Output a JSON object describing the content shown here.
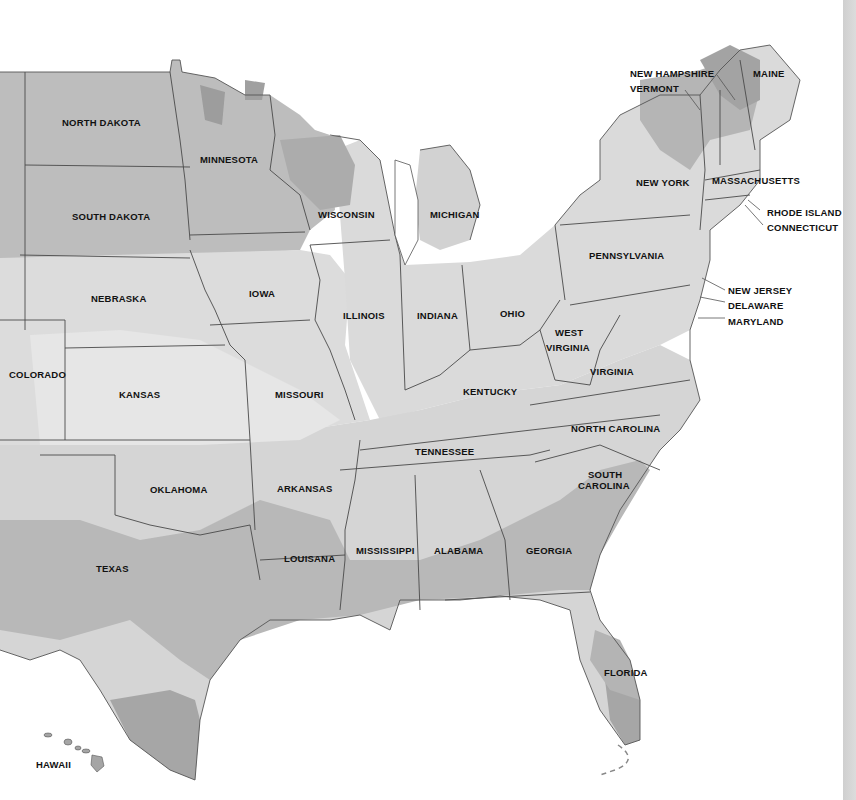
{
  "map": {
    "title": "United States regional shading map",
    "colors": {
      "background": "#ffffff",
      "lightest": "#ececec",
      "light": "#dedede",
      "medium": "#c6c6c6",
      "dark": "#a9a9a9",
      "darkest": "#8e8e8e",
      "border": "#4a4a4a",
      "label": "#111111"
    },
    "states": [
      {
        "name": "NORTH DAKOTA",
        "x": 62,
        "y": 117
      },
      {
        "name": "MINNESOTA",
        "x": 200,
        "y": 154
      },
      {
        "name": "SOUTH DAKOTA",
        "x": 72,
        "y": 211
      },
      {
        "name": "WISCONSIN",
        "x": 318,
        "y": 209
      },
      {
        "name": "MICHIGAN",
        "x": 430,
        "y": 209
      },
      {
        "name": "NEBRASKA",
        "x": 91,
        "y": 293
      },
      {
        "name": "IOWA",
        "x": 249,
        "y": 288
      },
      {
        "name": "ILLINOIS",
        "x": 343,
        "y": 310
      },
      {
        "name": "INDIANA",
        "x": 417,
        "y": 310
      },
      {
        "name": "OHIO",
        "x": 500,
        "y": 308
      },
      {
        "name": "COLORADO",
        "x": 9,
        "y": 369
      },
      {
        "name": "KANSAS",
        "x": 119,
        "y": 389
      },
      {
        "name": "MISSOURI",
        "x": 275,
        "y": 389
      },
      {
        "name": "KENTUCKY",
        "x": 463,
        "y": 386
      },
      {
        "name": "WEST",
        "x": 555,
        "y": 327
      },
      {
        "name": "VIRGINIA",
        "x": 546,
        "y": 342
      },
      {
        "name": "VIRGINIA",
        "x": 590,
        "y": 366
      },
      {
        "name": "PENNSYLVANIA",
        "x": 589,
        "y": 250
      },
      {
        "name": "NEW YORK",
        "x": 636,
        "y": 177
      },
      {
        "name": "NORTH CAROLINA",
        "x": 571,
        "y": 423
      },
      {
        "name": "TENNESSEE",
        "x": 415,
        "y": 446
      },
      {
        "name": "OKLAHOMA",
        "x": 150,
        "y": 484
      },
      {
        "name": "ARKANSAS",
        "x": 277,
        "y": 483
      },
      {
        "name": "SOUTH",
        "x": 588,
        "y": 469
      },
      {
        "name": "CAROLINA",
        "x": 578,
        "y": 480
      },
      {
        "name": "MISSISSIPPI",
        "x": 356,
        "y": 545
      },
      {
        "name": "ALABAMA",
        "x": 434,
        "y": 545
      },
      {
        "name": "GEORGIA",
        "x": 526,
        "y": 545
      },
      {
        "name": "TEXAS",
        "x": 96,
        "y": 563
      },
      {
        "name": "LOUISANA",
        "x": 284,
        "y": 553
      },
      {
        "name": "FLORIDA",
        "x": 604,
        "y": 667
      },
      {
        "name": "HAWAII",
        "x": 36,
        "y": 759
      }
    ],
    "callouts": [
      {
        "name": "NEW HAMPSHIRE",
        "x": 630,
        "y": 68
      },
      {
        "name": "VERMONT",
        "x": 630,
        "y": 83
      },
      {
        "name": "MAINE",
        "x": 753,
        "y": 68
      },
      {
        "name": "MASSACHUSETTS",
        "x": 712,
        "y": 175
      },
      {
        "name": "RHODE ISLAND",
        "x": 767,
        "y": 207
      },
      {
        "name": "CONNECTICUT",
        "x": 767,
        "y": 222
      },
      {
        "name": "NEW JERSEY",
        "x": 728,
        "y": 285
      },
      {
        "name": "DELAWARE",
        "x": 728,
        "y": 300
      },
      {
        "name": "MARYLAND",
        "x": 728,
        "y": 316
      }
    ]
  }
}
